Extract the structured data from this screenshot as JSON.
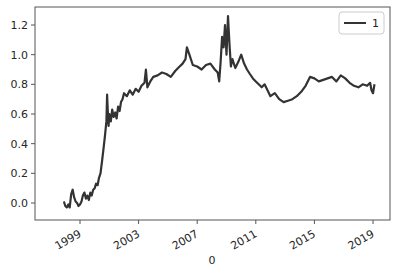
{
  "chart_data": {
    "type": "line",
    "title": "",
    "xlabel": "0",
    "ylabel": "",
    "xlim": [
      1996.8,
      2020.2
    ],
    "ylim": [
      -0.12,
      1.32
    ],
    "grid": false,
    "legend": {
      "position": "upper right",
      "entries": [
        "1"
      ]
    },
    "x_tick_labels": [
      "1999",
      "2003",
      "2007",
      "2011",
      "2015",
      "2019"
    ],
    "x_ticks": [
      1999,
      2003,
      2007,
      2011,
      2015,
      2019
    ],
    "y_tick_labels": [
      "0.0",
      "0.2",
      "0.4",
      "0.6",
      "0.8",
      "1.0",
      "1.2"
    ],
    "y_ticks": [
      0.0,
      0.2,
      0.4,
      0.6,
      0.8,
      1.0,
      1.2
    ],
    "series": [
      {
        "name": "1",
        "color": "#333333",
        "x": [
          1997.9,
          1998.0,
          1998.1,
          1998.2,
          1998.3,
          1998.4,
          1998.5,
          1998.6,
          1998.7,
          1998.8,
          1998.9,
          1999.0,
          1999.1,
          1999.2,
          1999.3,
          1999.4,
          1999.5,
          1999.6,
          1999.7,
          1999.8,
          1999.9,
          2000.0,
          2000.1,
          2000.2,
          2000.3,
          2000.4,
          2000.5,
          2000.6,
          2000.7,
          2000.8,
          2000.85,
          2000.9,
          2000.95,
          2001.0,
          2001.1,
          2001.2,
          2001.3,
          2001.4,
          2001.5,
          2001.6,
          2001.7,
          2001.8,
          2001.9,
          2002.0,
          2002.2,
          2002.4,
          2002.6,
          2002.8,
          2003.0,
          2003.2,
          2003.4,
          2003.5,
          2003.6,
          2003.8,
          2004.0,
          2004.3,
          2004.6,
          2004.9,
          2005.2,
          2005.5,
          2005.8,
          2006.0,
          2006.2,
          2006.3,
          2006.5,
          2006.7,
          2007.0,
          2007.3,
          2007.6,
          2007.9,
          2008.2,
          2008.4,
          2008.5,
          2008.6,
          2008.7,
          2008.8,
          2008.9,
          2009.0,
          2009.1,
          2009.2,
          2009.3,
          2009.4,
          2009.6,
          2009.8,
          2010.0,
          2010.2,
          2010.4,
          2010.6,
          2010.8,
          2011.0,
          2011.2,
          2011.4,
          2011.6,
          2011.8,
          2012.0,
          2012.3,
          2012.6,
          2012.9,
          2013.2,
          2013.5,
          2013.8,
          2014.1,
          2014.4,
          2014.7,
          2015.0,
          2015.3,
          2015.6,
          2015.9,
          2016.2,
          2016.5,
          2016.8,
          2017.1,
          2017.4,
          2017.7,
          2018.0,
          2018.3,
          2018.6,
          2018.8,
          2018.9,
          2019.0,
          2019.1
        ],
        "values": [
          0.01,
          -0.02,
          -0.03,
          -0.01,
          -0.03,
          0.06,
          0.09,
          0.04,
          0.01,
          0.0,
          -0.02,
          -0.01,
          0.01,
          0.05,
          0.07,
          0.03,
          0.05,
          0.02,
          0.07,
          0.05,
          0.09,
          0.1,
          0.13,
          0.12,
          0.17,
          0.2,
          0.28,
          0.36,
          0.45,
          0.55,
          0.73,
          0.62,
          0.52,
          0.6,
          0.55,
          0.63,
          0.58,
          0.61,
          0.57,
          0.65,
          0.62,
          0.68,
          0.7,
          0.74,
          0.72,
          0.76,
          0.73,
          0.77,
          0.75,
          0.79,
          0.81,
          0.9,
          0.78,
          0.82,
          0.85,
          0.86,
          0.88,
          0.87,
          0.85,
          0.89,
          0.92,
          0.94,
          0.97,
          1.05,
          0.99,
          0.93,
          0.92,
          0.9,
          0.93,
          0.94,
          0.9,
          0.88,
          0.82,
          0.95,
          1.12,
          1.05,
          1.2,
          1.0,
          1.26,
          1.08,
          0.92,
          0.97,
          0.91,
          0.95,
          1.0,
          0.94,
          0.9,
          0.87,
          0.84,
          0.82,
          0.8,
          0.78,
          0.8,
          0.76,
          0.72,
          0.74,
          0.7,
          0.68,
          0.69,
          0.7,
          0.72,
          0.75,
          0.79,
          0.85,
          0.84,
          0.82,
          0.83,
          0.84,
          0.85,
          0.82,
          0.86,
          0.84,
          0.81,
          0.79,
          0.78,
          0.8,
          0.79,
          0.81,
          0.76,
          0.74,
          0.8
        ]
      }
    ]
  },
  "plot_frame": {
    "left": 35,
    "top": 7,
    "right": 390,
    "bottom": 220,
    "x_pixel": {
      "1999": 80,
      "2019": 373
    },
    "y_pixel": {
      "0.0": 203,
      "1.2": 25
    }
  }
}
